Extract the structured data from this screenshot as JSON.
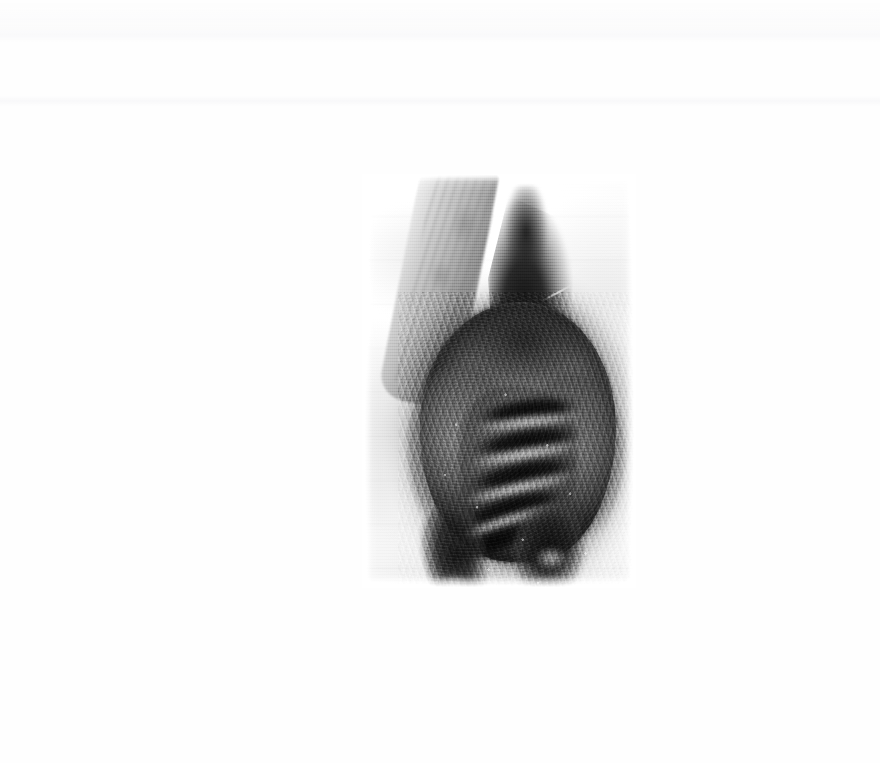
{
  "page": {
    "background_color": "#ffffff",
    "width": 880,
    "height": 763
  },
  "photograph": {
    "alt_text": "Black and white photograph of a raccoon seen from behind in deep snow beside a fallen log, its ringed tail curled beneath its body",
    "subject": "raccoon",
    "setting": "snow",
    "style": "black-and-white",
    "frame": {
      "left": 322,
      "top": 158,
      "width": 274,
      "height": 414
    },
    "elements": {
      "log_label": "fallen log",
      "hollow_label": "shadowed hollow",
      "body_label": "raccoon back and haunches",
      "tail_label": "ringed tail",
      "paw_left_label": "left hind foot",
      "paw_right_label": "right hind foot",
      "snow_label": "snow field"
    },
    "tail": {
      "ring_count": 5,
      "band_count": 4,
      "dark_ring_color": "#101010",
      "light_band_color": "#dcdcdc"
    },
    "tones": {
      "snow_white": "#ffffff",
      "snow_shadow": "#cdcdcd",
      "fur_mid": "#6b6b6b",
      "fur_dark": "#2d2d2d",
      "deep_shadow": "#0e0e0e"
    }
  }
}
